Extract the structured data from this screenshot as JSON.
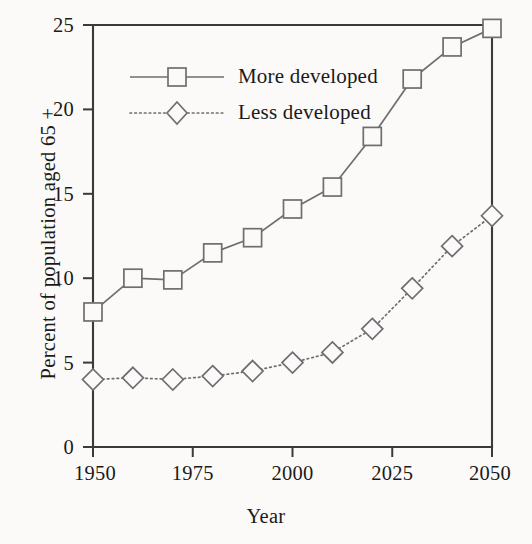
{
  "chart_data": {
    "type": "line",
    "title": "",
    "xlabel": "Year",
    "ylabel": "Percent of population aged 65 +",
    "xlim": [
      1950,
      2050
    ],
    "ylim": [
      0,
      25
    ],
    "xticks": [
      1950,
      1975,
      2000,
      2025,
      2050
    ],
    "yticks": [
      0,
      5,
      10,
      15,
      20,
      25
    ],
    "grid": false,
    "legend_position": "upper-left-inside",
    "x": [
      1950,
      1960,
      1970,
      1980,
      1990,
      2000,
      2010,
      2020,
      2030,
      2040,
      2050
    ],
    "series": [
      {
        "name": "More developed",
        "marker": "square",
        "linestyle": "solid",
        "values": [
          8.0,
          10.0,
          9.9,
          11.5,
          12.4,
          14.1,
          15.4,
          18.4,
          21.8,
          23.7,
          24.8
        ]
      },
      {
        "name": "Less developed",
        "marker": "diamond",
        "linestyle": "dotted",
        "values": [
          4.0,
          4.1,
          4.0,
          4.2,
          4.5,
          5.0,
          5.6,
          7.0,
          9.4,
          11.9,
          13.7
        ]
      }
    ]
  },
  "axes": {
    "y_title": "Percent of population aged 65 +",
    "x_title": "Year",
    "y_tick_labels": [
      "25",
      "20",
      "15",
      "10",
      "5",
      "0"
    ],
    "x_tick_labels": [
      "1950",
      "1975",
      "2000",
      "2025",
      "2050"
    ]
  },
  "legend": {
    "entries": [
      {
        "label": "More developed",
        "marker": "square-marker",
        "style": "solid"
      },
      {
        "label": "Less developed",
        "marker": "diamond-marker",
        "style": "dotted"
      }
    ]
  },
  "colors": {
    "background": "#fbfaf8",
    "axis": "#3a3a3a",
    "series": "#6e6e72",
    "text": "#1a1a1a"
  }
}
